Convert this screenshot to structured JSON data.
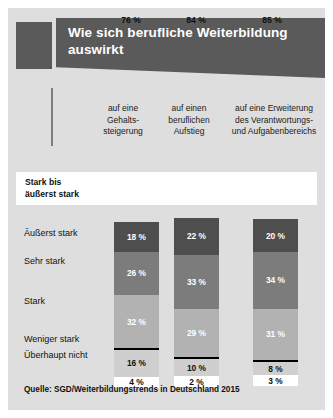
{
  "title": "Wie sich berufliche Weiterbildung auswirkt",
  "source": "Quelle: SGD/Weiterbildungstrends in Deutschland 2015",
  "columns": [
    {
      "line1": "auf eine",
      "line2": "Gehalts-",
      "line3": "steigerung"
    },
    {
      "line1": "auf einen",
      "line2": "beruflichen",
      "line3": "Aufstieg"
    },
    {
      "line1": "auf eine Erweiterung",
      "line2": "des Verantwortungs-",
      "line3": "und Aufgabenbereichs"
    }
  ],
  "summary": {
    "label_line1": "Stark bis",
    "label_line2": "äußerst stark",
    "values": [
      "76 %",
      "84 %",
      "85 %"
    ]
  },
  "categories": [
    "Äußerst stark",
    "Sehr stark",
    "Stark",
    "Weniger stark",
    "Überhaupt nicht"
  ],
  "colors": {
    "panel": "#dedede",
    "banner": "#5a5a5a",
    "seg0": "#4e4e4e",
    "seg1": "#7c7c7c",
    "seg2": "#b2b2b2",
    "seg3": "#cfcfcf",
    "seg4": "#ffffff"
  },
  "chart_data": {
    "type": "bar",
    "title": "Wie sich berufliche Weiterbildung auswirkt",
    "subtype": "stacked-bar",
    "xlabel": "",
    "ylabel": "",
    "ylim": [
      0,
      100
    ],
    "grid": false,
    "legend": "left-labels",
    "categories": [
      "Äußerst stark",
      "Sehr stark",
      "Stark",
      "Weniger stark",
      "Überhaupt nicht"
    ],
    "series": [
      {
        "name": "auf eine Gehaltssteigerung",
        "values": [
          18,
          26,
          32,
          16,
          4
        ],
        "labels": [
          "18 %",
          "26 %",
          "32 %",
          "16 %",
          "4 %"
        ],
        "summary": "76 %"
      },
      {
        "name": "auf einen beruflichen Aufstieg",
        "values": [
          22,
          33,
          29,
          10,
          2
        ],
        "labels": [
          "22 %",
          "33 %",
          "29 %",
          "10 %",
          "2 %"
        ],
        "summary": "84 %"
      },
      {
        "name": "auf eine Erweiterung des Verantwortungs- und Aufgabenbereichs",
        "values": [
          20,
          34,
          31,
          8,
          3
        ],
        "labels": [
          "20 %",
          "34 %",
          "31 %",
          "8 %",
          "3 %"
        ],
        "summary": "85 %"
      }
    ],
    "summary_row_label": "Stark bis äußerst stark",
    "source": "Quelle: SGD/Weiterbildungstrends in Deutschland 2015"
  }
}
